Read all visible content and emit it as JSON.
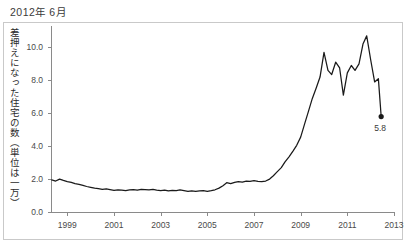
{
  "title": "2012年 6月",
  "colors": {
    "line": "#1a1a1a",
    "axis": "#8a8a8a",
    "tick_text": "#4a4a4a",
    "title_text": "#3b3b3b",
    "border": "#c9c9c9",
    "background": "#ffffff"
  },
  "annotation": {
    "label": "5.8",
    "value": 5.8
  },
  "chart_data": {
    "type": "line",
    "title": "2012年 6月",
    "xlabel": "",
    "ylabel": "差押えになった住宅の数（単位は一万）",
    "xlim": [
      1998.3,
      2013.0
    ],
    "ylim": [
      0.0,
      11.3
    ],
    "grid": false,
    "legend": null,
    "xticks": [
      1999,
      2001,
      2003,
      2005,
      2007,
      2009,
      2011,
      2013
    ],
    "xtick_labels": [
      "1999",
      "2001",
      "2003",
      "2005",
      "2007",
      "2009",
      "2011",
      "2013"
    ],
    "yticks": [
      0.0,
      2.0,
      4.0,
      6.0,
      8.0,
      10.0
    ],
    "ytick_labels": [
      "0.0",
      "2.0",
      "4.0",
      "6.0",
      "8.0",
      "10.0"
    ],
    "annotations": [
      {
        "x": 2012.45,
        "y": 5.8,
        "text": "5.8",
        "marker": "dot"
      }
    ],
    "series": [
      {
        "name": "差押えになった住宅の数",
        "x": [
          1998.33,
          1998.5,
          1998.67,
          1998.83,
          1999.0,
          1999.17,
          1999.33,
          1999.5,
          1999.67,
          1999.83,
          2000.0,
          2000.17,
          2000.33,
          2000.5,
          2000.67,
          2000.83,
          2001.0,
          2001.17,
          2001.33,
          2001.5,
          2001.67,
          2001.83,
          2002.0,
          2002.17,
          2002.33,
          2002.5,
          2002.67,
          2002.83,
          2003.0,
          2003.17,
          2003.33,
          2003.5,
          2003.67,
          2003.83,
          2004.0,
          2004.17,
          2004.33,
          2004.5,
          2004.67,
          2004.83,
          2005.0,
          2005.17,
          2005.33,
          2005.5,
          2005.67,
          2005.83,
          2006.0,
          2006.17,
          2006.33,
          2006.5,
          2006.67,
          2006.83,
          2007.0,
          2007.17,
          2007.33,
          2007.5,
          2007.67,
          2007.83,
          2008.0,
          2008.17,
          2008.33,
          2008.5,
          2008.67,
          2008.83,
          2009.0,
          2009.17,
          2009.33,
          2009.5,
          2009.67,
          2009.83,
          2010.0,
          2010.17,
          2010.33,
          2010.5,
          2010.67,
          2010.83,
          2011.0,
          2011.17,
          2011.33,
          2011.5,
          2011.67,
          2011.83,
          2012.0,
          2012.17,
          2012.33,
          2012.45
        ],
        "y": [
          1.95,
          1.88,
          2.0,
          1.92,
          1.85,
          1.8,
          1.72,
          1.68,
          1.62,
          1.55,
          1.5,
          1.45,
          1.42,
          1.38,
          1.4,
          1.36,
          1.32,
          1.35,
          1.33,
          1.3,
          1.34,
          1.36,
          1.33,
          1.38,
          1.36,
          1.34,
          1.37,
          1.33,
          1.3,
          1.33,
          1.28,
          1.32,
          1.3,
          1.34,
          1.3,
          1.26,
          1.29,
          1.25,
          1.28,
          1.3,
          1.26,
          1.3,
          1.35,
          1.45,
          1.6,
          1.78,
          1.72,
          1.8,
          1.85,
          1.82,
          1.88,
          1.86,
          1.9,
          1.86,
          1.84,
          1.88,
          2.0,
          2.2,
          2.45,
          2.7,
          3.05,
          3.35,
          3.7,
          4.05,
          4.55,
          5.35,
          6.1,
          6.9,
          7.55,
          8.2,
          9.7,
          8.6,
          8.35,
          9.1,
          8.75,
          7.1,
          8.45,
          8.9,
          8.6,
          9.0,
          10.2,
          10.7,
          9.25,
          7.9,
          8.1,
          5.8
        ]
      }
    ]
  },
  "axis_geometry": {
    "plot_left_px": 51,
    "plot_right_px": 394,
    "plot_top_px": 26,
    "plot_bottom_px": 212
  }
}
